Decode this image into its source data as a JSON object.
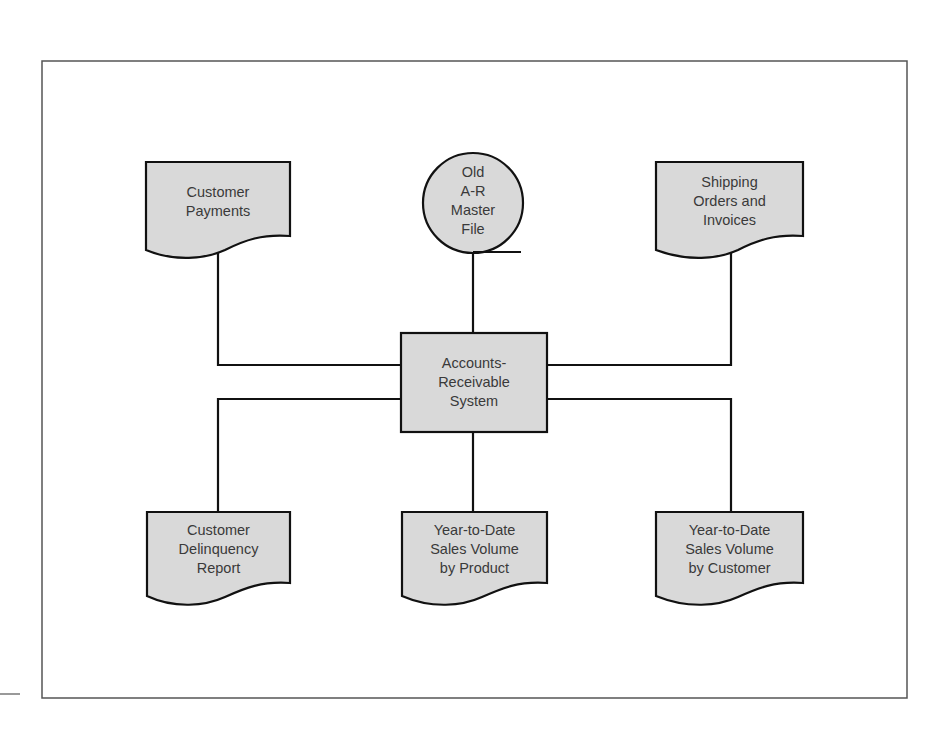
{
  "diagram": {
    "type": "system-flowchart",
    "colors": {
      "fill": "#d9d9d9",
      "stroke": "#111111",
      "text": "#3a3a3a",
      "frame": "#555555"
    },
    "center": {
      "shape": "process-rectangle",
      "lines": [
        "Accounts-",
        "Receivable",
        "System"
      ]
    },
    "inputs": [
      {
        "id": "customer-payments",
        "shape": "document",
        "lines": [
          "Customer",
          "Payments"
        ]
      },
      {
        "id": "old-ar-master-file",
        "shape": "magnetic-tape",
        "lines": [
          "Old",
          "A-R",
          "Master",
          "File"
        ]
      },
      {
        "id": "shipping-orders",
        "shape": "document",
        "lines": [
          "Shipping",
          "Orders and",
          "Invoices"
        ]
      }
    ],
    "outputs": [
      {
        "id": "customer-delinquency",
        "shape": "document",
        "lines": [
          "Customer",
          "Delinquency",
          "Report"
        ]
      },
      {
        "id": "ytd-by-product",
        "shape": "document",
        "lines": [
          "Year-to-Date",
          "Sales Volume",
          "by Product"
        ]
      },
      {
        "id": "ytd-by-customer",
        "shape": "document",
        "lines": [
          "Year-to-Date",
          "Sales Volume",
          "by Customer"
        ]
      }
    ]
  }
}
